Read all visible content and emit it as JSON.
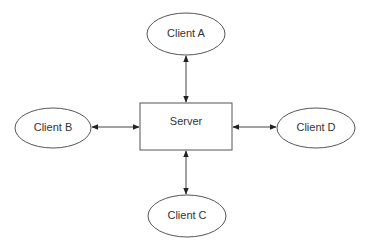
{
  "diagram": {
    "type": "client-server star topology",
    "nodes": {
      "server": {
        "label": "Server",
        "shape": "rectangle"
      },
      "client_a": {
        "label": "Client A",
        "shape": "ellipse"
      },
      "client_b": {
        "label": "Client B",
        "shape": "ellipse"
      },
      "client_c": {
        "label": "Client C",
        "shape": "ellipse"
      },
      "client_d": {
        "label": "Client D",
        "shape": "ellipse"
      }
    },
    "edges": [
      {
        "from": "client_a",
        "to": "server",
        "direction": "bidirectional"
      },
      {
        "from": "client_b",
        "to": "server",
        "direction": "bidirectional"
      },
      {
        "from": "client_c",
        "to": "server",
        "direction": "bidirectional"
      },
      {
        "from": "client_d",
        "to": "server",
        "direction": "bidirectional"
      }
    ],
    "colors": {
      "stroke": "#444444",
      "background": "#ffffff",
      "text": "#333333"
    }
  }
}
